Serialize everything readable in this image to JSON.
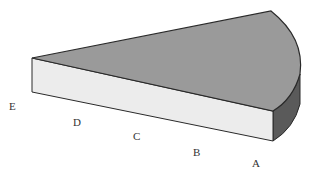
{
  "diagram": {
    "type": "3d-wedge-sector",
    "colors": {
      "top_face": "#9a9a9a",
      "front_face": "#ececec",
      "arc_side_face": "#5a5a5a",
      "edge": "#2a2a2a",
      "label": "#333333"
    },
    "labels": [
      {
        "id": "E",
        "text": "E",
        "x": 9,
        "y": 101
      },
      {
        "id": "D",
        "text": "D",
        "x": 73,
        "y": 117
      },
      {
        "id": "C",
        "text": "C",
        "x": 133,
        "y": 131
      },
      {
        "id": "B",
        "text": "B",
        "x": 193,
        "y": 147
      },
      {
        "id": "A",
        "text": "A",
        "x": 252,
        "y": 158
      }
    ]
  }
}
